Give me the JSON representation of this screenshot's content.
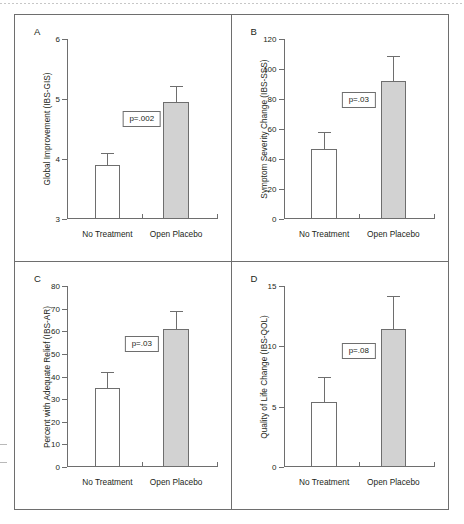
{
  "figure": {
    "categories": [
      "No Treatment",
      "Open Placebo"
    ],
    "series_names": [
      "No Treatment",
      "Open Placebo"
    ],
    "bar_colors": {
      "no_treatment": "#ffffff",
      "open_placebo": "#d2d2d2"
    },
    "axis_color": "#6e6e6e"
  },
  "panels": [
    {
      "letter": "A",
      "ylabel": "Global Improvement (IBS-GIS)",
      "ymin": 3,
      "ymax": 6,
      "yticks": [
        3,
        4,
        5,
        6
      ],
      "ytick_labels": [
        "3",
        "4",
        "5",
        "6"
      ],
      "pvalue": "p=.002",
      "values": [
        3.9,
        4.95
      ],
      "errors_top": [
        4.1,
        5.22
      ]
    },
    {
      "letter": "B",
      "ylabel": "Symptom Severity Change (IBS-SSS)",
      "ymin": 0,
      "ymax": 120,
      "yticks": [
        0,
        20,
        40,
        60,
        80,
        100,
        120
      ],
      "ytick_labels": [
        "0",
        "20",
        "40",
        "60",
        "80",
        "100",
        "120"
      ],
      "pvalue": "p=.03",
      "values": [
        47,
        92
      ],
      "errors_top": [
        58,
        109
      ]
    },
    {
      "letter": "C",
      "ylabel": "Percent with Adequate Relief (IBS-AR)",
      "ymin": 0,
      "ymax": 80,
      "yticks": [
        0,
        10,
        20,
        30,
        40,
        50,
        60,
        70,
        80
      ],
      "ytick_labels": [
        "0",
        "10",
        "20",
        "30",
        "40",
        "50",
        "60",
        "70",
        "80"
      ],
      "pvalue": "p=.03",
      "values": [
        35,
        61
      ],
      "errors_top": [
        42,
        69
      ]
    },
    {
      "letter": "D",
      "ylabel": "Quality of Life Change (IBS-QOL)",
      "ymin": 0,
      "ymax": 15,
      "yticks": [
        0,
        5,
        10,
        15
      ],
      "ytick_labels": [
        "0",
        "5",
        "10",
        "15"
      ],
      "pvalue": "p=.08",
      "values": [
        5.4,
        11.4
      ],
      "errors_top": [
        7.5,
        14.2
      ]
    }
  ],
  "chart_data": {
    "type": "bar",
    "title": "",
    "layout": "2x2 panel grid of grouped bar charts with SEM error bars",
    "categories": [
      "No Treatment",
      "Open Placebo"
    ],
    "grid": false,
    "legend": "none",
    "panels": [
      {
        "panel": "A",
        "title": "A",
        "ylabel": "Global Improvement (IBS-GIS)",
        "xlabel": "",
        "ylim": [
          3,
          6
        ],
        "yticks": [
          3,
          4,
          5,
          6
        ],
        "values": [
          3.9,
          4.95
        ],
        "error_upper": [
          0.2,
          0.27
        ],
        "annotation": "p=.002"
      },
      {
        "panel": "B",
        "title": "B",
        "ylabel": "Symptom Severity Change (IBS-SSS)",
        "xlabel": "",
        "ylim": [
          0,
          120
        ],
        "yticks": [
          0,
          20,
          40,
          60,
          80,
          100,
          120
        ],
        "values": [
          47,
          92
        ],
        "error_upper": [
          11,
          17
        ],
        "annotation": "p=.03"
      },
      {
        "panel": "C",
        "title": "C",
        "ylabel": "Percent with Adequate Relief (IBS-AR)",
        "xlabel": "",
        "ylim": [
          0,
          80
        ],
        "yticks": [
          0,
          10,
          20,
          30,
          40,
          50,
          60,
          70,
          80
        ],
        "values": [
          35,
          61
        ],
        "error_upper": [
          7,
          8
        ],
        "annotation": "p=.03"
      },
      {
        "panel": "D",
        "title": "D",
        "ylabel": "Quality of Life Change (IBS-QOL)",
        "xlabel": "",
        "ylim": [
          0,
          15
        ],
        "yticks": [
          0,
          5,
          10,
          15
        ],
        "values": [
          5.4,
          11.4
        ],
        "error_upper": [
          2.1,
          2.8
        ],
        "annotation": "p=.08"
      }
    ]
  }
}
